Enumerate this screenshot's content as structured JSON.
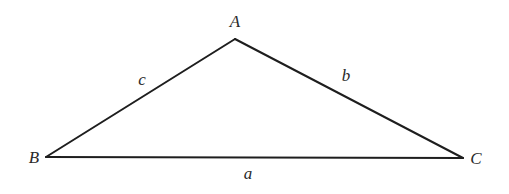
{
  "diagram": {
    "type": "triangle",
    "vertices": {
      "A": {
        "label": "A",
        "x": 235,
        "y": 39,
        "label_x": 235,
        "label_y": 27
      },
      "B": {
        "label": "B",
        "x": 46,
        "y": 157,
        "label_x": 34,
        "label_y": 163
      },
      "C": {
        "label": "C",
        "x": 463,
        "y": 158,
        "label_x": 476,
        "label_y": 164
      }
    },
    "sides": {
      "a": {
        "label": "a",
        "between": [
          "B",
          "C"
        ],
        "label_x": 248,
        "label_y": 179
      },
      "b": {
        "label": "b",
        "between": [
          "A",
          "C"
        ],
        "label_x": 346,
        "label_y": 81
      },
      "c": {
        "label": "c",
        "between": [
          "A",
          "B"
        ],
        "label_x": 142,
        "label_y": 85
      }
    },
    "colors": {
      "stroke": "#1e1e1e",
      "text": "#2a2a2a",
      "background": "#ffffff"
    }
  }
}
